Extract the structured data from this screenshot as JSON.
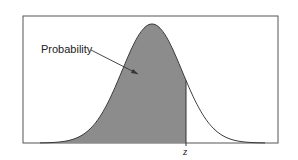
{
  "figure": {
    "type": "normal-distribution-cdf-diagram",
    "annotation_label": "Probability",
    "x_marker_label": "z",
    "colors": {
      "shaded_area": "#8c8c8c",
      "curve": "#3a3a3a",
      "frame": "#555555",
      "background": "#ffffff"
    }
  },
  "chart_data": {
    "type": "area",
    "title": "",
    "xlabel": "",
    "ylabel": "",
    "x_marker": {
      "label": "z",
      "position_sd": 1.13
    },
    "shaded_region": "left tail up to z",
    "annotations": [
      "Probability"
    ],
    "grid": false,
    "legend": "none"
  }
}
